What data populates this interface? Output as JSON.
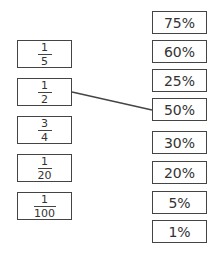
{
  "fractions": [
    {
      "num": "1",
      "den": "5"
    },
    {
      "num": "1",
      "den": "2"
    },
    {
      "num": "3",
      "den": "4"
    },
    {
      "num": "1",
      "den": "20"
    },
    {
      "num": "1",
      "den": "100"
    }
  ],
  "percentages": [
    "75%",
    "60%",
    "25%",
    "50%",
    "30%",
    "20%",
    "5%",
    "1%"
  ],
  "connections": [
    {
      "fraction": "1/2",
      "percentage": "50%"
    }
  ],
  "colors": {
    "border": "#444444",
    "text": "#333333"
  }
}
